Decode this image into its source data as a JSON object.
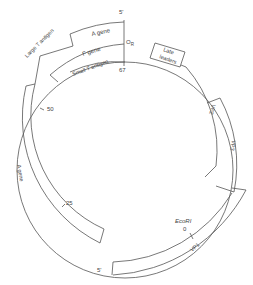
{
  "diagram": {
    "type": "circular-genome-map",
    "colors": {
      "stroke": "#555555",
      "text": "#444444",
      "background": "#ffffff"
    },
    "map_units": [
      {
        "id": "mu-0",
        "label": "0"
      },
      {
        "id": "mu-25",
        "label": "25"
      },
      {
        "id": "mu-50",
        "label": "50"
      },
      {
        "id": "mu-67",
        "label": "67"
      }
    ],
    "markers": {
      "origin": "O",
      "origin_sub": "R",
      "ecori": "EcoRI",
      "ecori_zero": "0",
      "five_prime_top": "5'",
      "five_prime_bottom": "5'"
    },
    "genes": {
      "a_gene_top": "A gene",
      "f_gene": "F gene",
      "small_t": "Small T antigen",
      "large_t": "Large T antigen",
      "a_gene_left": "A gene",
      "late_leaders": [
        "Late",
        "leaders"
      ],
      "vp2": "VP2",
      "vp3": "VP3",
      "vp1": "VP1"
    }
  }
}
